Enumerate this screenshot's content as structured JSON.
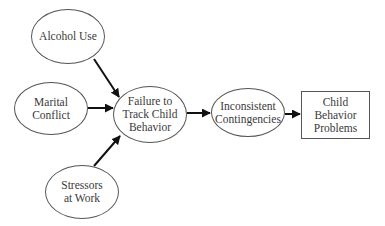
{
  "diagram": {
    "type": "path-diagram",
    "nodes": [
      {
        "id": "alcohol",
        "shape": "ellipse",
        "label": "Alcohol Use"
      },
      {
        "id": "marital",
        "shape": "ellipse",
        "label": "Marital\nConflict"
      },
      {
        "id": "stressors",
        "shape": "ellipse",
        "label": "Stressors\nat Work"
      },
      {
        "id": "failure",
        "shape": "ellipse",
        "label": "Failure to\nTrack Child\nBehavior"
      },
      {
        "id": "inconsistent",
        "shape": "ellipse",
        "label": "Inconsistent\nContingencies"
      },
      {
        "id": "problems",
        "shape": "rectangle",
        "label": "Child\nBehavior\nProblems"
      }
    ],
    "edges": [
      {
        "from": "alcohol",
        "to": "failure"
      },
      {
        "from": "marital",
        "to": "failure"
      },
      {
        "from": "stressors",
        "to": "failure"
      },
      {
        "from": "failure",
        "to": "inconsistent"
      },
      {
        "from": "inconsistent",
        "to": "problems"
      }
    ],
    "colors": {
      "stroke": "#555555",
      "arrow": "#111111",
      "text": "#3a3a3a",
      "background": "#ffffff"
    }
  }
}
